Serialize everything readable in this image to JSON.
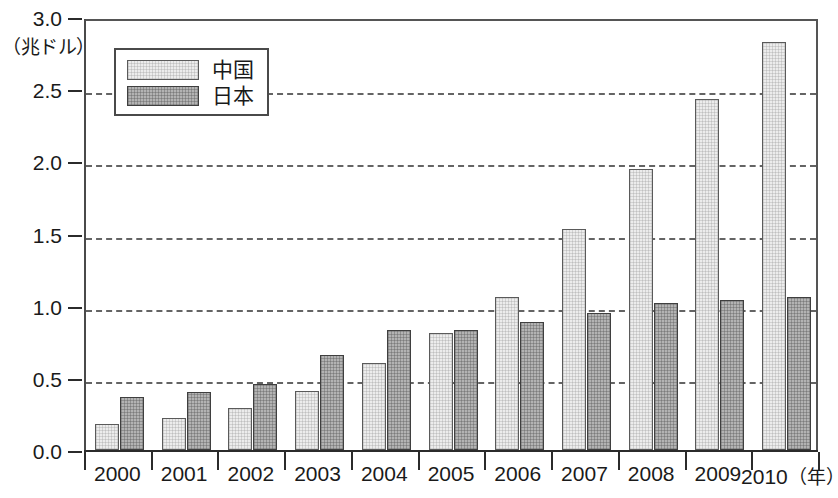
{
  "chart_data": {
    "type": "bar",
    "title": "",
    "xlabel": "（年）",
    "ylabel": "（兆ドル）",
    "ylim": [
      0.0,
      3.0
    ],
    "ytick_labels": [
      "0.0",
      "0.5",
      "1.0",
      "1.5",
      "2.0",
      "2.5",
      "3.0"
    ],
    "ytick_values": [
      0.0,
      0.5,
      1.0,
      1.5,
      2.0,
      2.5,
      3.0
    ],
    "grid": "horizontal-dashed",
    "legend_position": "upper-left-inside",
    "categories": [
      "2000",
      "2001",
      "2002",
      "2003",
      "2004",
      "2005",
      "2006",
      "2007",
      "2008",
      "2009",
      "2010"
    ],
    "series": [
      {
        "name": "中国",
        "color": "#ececec",
        "values": [
          0.18,
          0.22,
          0.29,
          0.41,
          0.6,
          0.81,
          1.06,
          1.53,
          1.95,
          2.43,
          2.83
        ]
      },
      {
        "name": "日本",
        "color": "#b3b3b3",
        "values": [
          0.37,
          0.4,
          0.46,
          0.66,
          0.83,
          0.83,
          0.89,
          0.95,
          1.02,
          1.04,
          1.06
        ]
      }
    ]
  },
  "axes": {
    "unit_label": "（兆ドル）",
    "year_suffix": "（年）"
  },
  "legend": {
    "entries": [
      {
        "label": "中国"
      },
      {
        "label": "日本"
      }
    ]
  },
  "colors": {
    "china_fill": "#ececec",
    "japan_fill": "#b3b3b3",
    "axis": "#2b2b2b",
    "grid": "#4a4a4a",
    "text": "#1a1a1a"
  }
}
